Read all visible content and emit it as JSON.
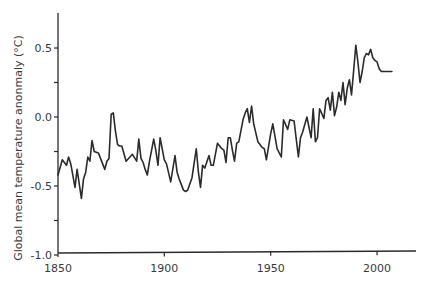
{
  "chart_data": {
    "type": "line",
    "title": "",
    "xlabel": "",
    "ylabel": "Global mean temperature anonmaly (°C)",
    "xlim": [
      1850,
      2019
    ],
    "ylim": [
      -1.0,
      0.75
    ],
    "xticks": [
      1850,
      1900,
      1950,
      2000
    ],
    "xtick_labels": [
      "1850",
      "1900",
      "1950",
      "2000"
    ],
    "yticks": [
      -1.0,
      -0.75,
      -0.5,
      -0.25,
      0.0,
      0.25,
      0.5
    ],
    "ytick_labels": [
      "-1.0",
      "",
      "-0.5",
      "",
      "0.0",
      "",
      "0.5"
    ],
    "grid": false,
    "legend": null,
    "series": [
      {
        "name": "Global mean temperature anomaly",
        "color": "#2b2b2b",
        "x": [
          1850,
          1852,
          1854,
          1855,
          1856,
          1858,
          1859,
          1861,
          1862,
          1863,
          1864,
          1865,
          1866,
          1867,
          1869,
          1870,
          1872,
          1873,
          1874,
          1875,
          1876,
          1877,
          1878,
          1879,
          1880,
          1882,
          1885,
          1887,
          1888,
          1889,
          1890,
          1891,
          1892,
          1893,
          1895,
          1896,
          1897,
          1898,
          1900,
          1901,
          1903,
          1905,
          1906,
          1907,
          1909,
          1910,
          1911,
          1913,
          1915,
          1916,
          1917,
          1918,
          1919,
          1921,
          1922,
          1923,
          1925,
          1927,
          1928,
          1929,
          1930,
          1931,
          1932,
          1933,
          1934,
          1935,
          1937,
          1938,
          1939,
          1940,
          1941,
          1942,
          1944,
          1946,
          1947,
          1948,
          1950,
          1951,
          1953,
          1955,
          1956,
          1958,
          1959,
          1961,
          1963,
          1964,
          1965,
          1967,
          1969,
          1970,
          1971,
          1972,
          1973,
          1975,
          1976,
          1977,
          1978,
          1979,
          1980,
          1981,
          1982,
          1983,
          1984,
          1985,
          1986,
          1987,
          1988,
          1989,
          1990,
          1991,
          1992,
          1993,
          1994,
          1995,
          1996,
          1997,
          1998,
          1999,
          2000,
          2001,
          2002,
          2003,
          2004,
          2005,
          2006,
          2007
        ],
        "values": [
          -0.42,
          -0.31,
          -0.35,
          -0.29,
          -0.34,
          -0.51,
          -0.38,
          -0.59,
          -0.45,
          -0.4,
          -0.29,
          -0.32,
          -0.17,
          -0.25,
          -0.26,
          -0.3,
          -0.38,
          -0.32,
          -0.3,
          0.02,
          0.03,
          -0.1,
          -0.2,
          -0.21,
          -0.21,
          -0.32,
          -0.27,
          -0.32,
          -0.16,
          -0.3,
          -0.33,
          -0.38,
          -0.42,
          -0.32,
          -0.16,
          -0.24,
          -0.35,
          -0.15,
          -0.31,
          -0.34,
          -0.47,
          -0.28,
          -0.4,
          -0.45,
          -0.53,
          -0.54,
          -0.53,
          -0.44,
          -0.23,
          -0.4,
          -0.51,
          -0.35,
          -0.37,
          -0.28,
          -0.35,
          -0.35,
          -0.19,
          -0.23,
          -0.24,
          -0.33,
          -0.15,
          -0.15,
          -0.24,
          -0.32,
          -0.19,
          -0.18,
          -0.02,
          0.03,
          0.06,
          -0.04,
          0.08,
          -0.05,
          -0.18,
          -0.22,
          -0.23,
          -0.31,
          -0.12,
          -0.05,
          -0.23,
          -0.29,
          -0.02,
          -0.09,
          -0.02,
          -0.03,
          -0.29,
          -0.15,
          -0.11,
          0.0,
          -0.15,
          0.06,
          -0.18,
          -0.15,
          0.06,
          -0.01,
          0.12,
          0.14,
          0.05,
          0.18,
          0.01,
          0.07,
          0.18,
          0.12,
          0.25,
          0.09,
          0.21,
          0.27,
          0.16,
          0.34,
          0.52,
          0.4,
          0.25,
          0.33,
          0.43,
          0.46,
          0.45,
          0.49,
          0.43,
          0.41,
          0.4,
          0.35,
          0.33,
          0.33,
          0.33,
          0.33,
          0.33,
          0.33
        ]
      }
    ]
  },
  "layout": {
    "plot_left_px": 58,
    "plot_right_px": 416,
    "axis_top_px": 13,
    "axis_bottom_px": 253,
    "x_px_per_year": 2.127,
    "y_zero_px": 117,
    "y_px_per_unit": 138
  }
}
